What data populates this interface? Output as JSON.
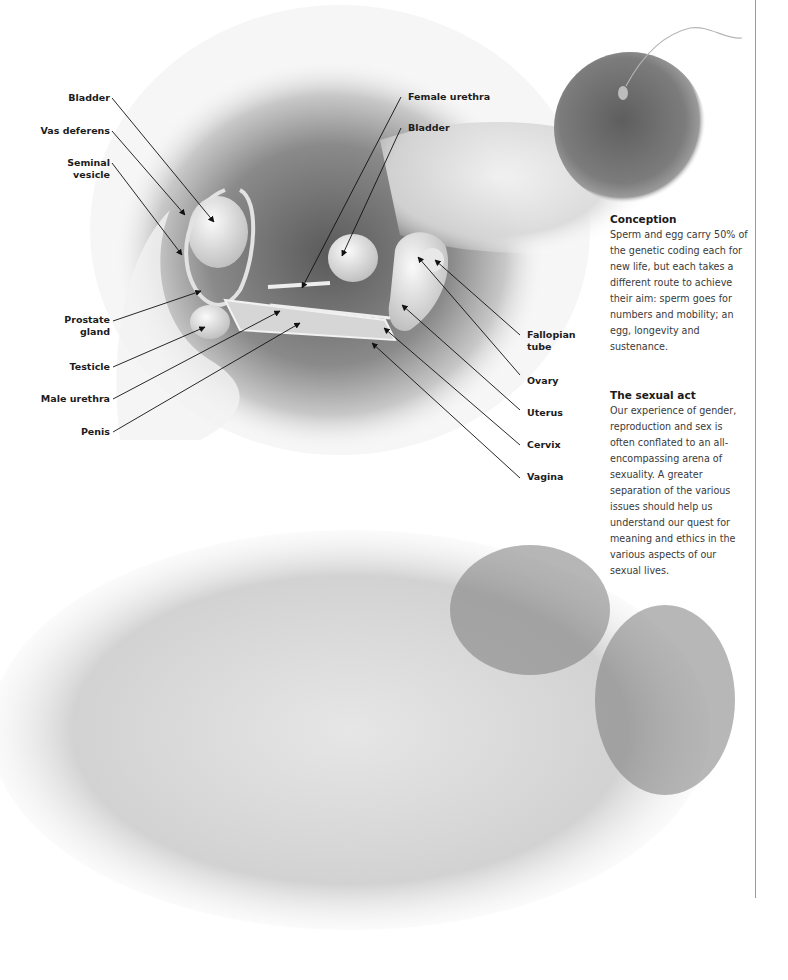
{
  "diagram": {
    "male_labels": [
      {
        "id": "bladder-male",
        "text": "Bladder"
      },
      {
        "id": "vas-deferens",
        "text": "Vas deferens"
      },
      {
        "id": "seminal-vesicle",
        "text": "Seminal\nvesicle"
      },
      {
        "id": "prostate-gland",
        "text": "Prostate\ngland"
      },
      {
        "id": "testicle",
        "text": "Testicle"
      },
      {
        "id": "male-urethra",
        "text": "Male urethra"
      },
      {
        "id": "penis",
        "text": "Penis"
      }
    ],
    "female_labels_top": [
      {
        "id": "female-urethra",
        "text": "Female urethra"
      },
      {
        "id": "bladder-female",
        "text": "Bladder"
      }
    ],
    "female_labels_right": [
      {
        "id": "fallopian-tube",
        "text": "Fallopian\ntube"
      },
      {
        "id": "ovary",
        "text": "Ovary"
      },
      {
        "id": "uterus",
        "text": "Uterus"
      },
      {
        "id": "cervix",
        "text": "Cervix"
      },
      {
        "id": "vagina",
        "text": "Vagina"
      }
    ]
  },
  "sidebar": {
    "conception": {
      "heading": "Conception",
      "body": "Sperm and egg carry 50% of the genetic coding each for new life, but each takes a different route to achieve their aim: sperm goes for numbers and mobility; an egg, longevity and sustenance."
    },
    "sexual_act": {
      "heading": "The sexual act",
      "body": "Our experience of gender, reproduction and sex is often conflated to an all-encompassing arena of sexuality. A greater separation of the various issues should help us understand our quest for meaning and ethics in the various aspects of our sexual lives."
    }
  },
  "images": {
    "micrograph": "egg-with-sperm",
    "illustration": "embracing-figures"
  }
}
